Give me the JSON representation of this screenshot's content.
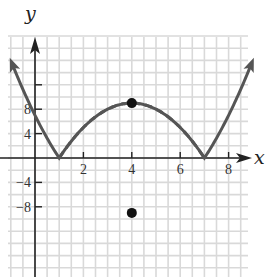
{
  "chart_data": {
    "type": "line",
    "title": "",
    "xlabel": "x",
    "ylabel": "y",
    "xlim": [
      -1.1,
      9.1
    ],
    "ylim": [
      -19.5,
      20
    ],
    "grid": true,
    "grid_step": {
      "x": 0.5,
      "y": 2
    },
    "x_ticks": [
      2,
      4,
      6,
      8
    ],
    "x_tick_labels": [
      "2",
      "4",
      "6",
      "8"
    ],
    "y_ticks": [
      -8,
      -4,
      4,
      8,
      12
    ],
    "y_tick_labels": [
      "-8",
      "-4",
      "4",
      "8",
      ""
    ],
    "series": [
      {
        "name": "y = |-x^2 + 8x - 7|",
        "style": "solid",
        "color": "#555555",
        "description": "Absolute value of parabola, zeros at x=1 and x=7, local max at (4, 9), arrows at both ends",
        "points": [
          [
            -0.9,
            15.0
          ],
          [
            0,
            7
          ],
          [
            1,
            0
          ],
          [
            2,
            5
          ],
          [
            3,
            8
          ],
          [
            4,
            9
          ],
          [
            5,
            8
          ],
          [
            6,
            5
          ],
          [
            7,
            0
          ],
          [
            8,
            7
          ],
          [
            8.9,
            15.0
          ]
        ]
      },
      {
        "name": "y = -x^2 + 8x - 7 (reflected portion)",
        "style": "dashed",
        "color": "#555555",
        "description": "Portion of original parabola below x-axis between zeros, shown dashed",
        "points": [
          [
            1,
            0
          ],
          [
            2,
            -5
          ],
          [
            3,
            -8
          ],
          [
            4,
            -9
          ],
          [
            5,
            -8
          ],
          [
            6,
            -5
          ],
          [
            7,
            0
          ]
        ]
      }
    ],
    "marked_points": [
      {
        "x": 4,
        "y": 9,
        "label": ""
      },
      {
        "x": 4,
        "y": -9,
        "label": ""
      }
    ],
    "colors": {
      "curve": "#555555",
      "axis": "#222222",
      "grid": "#d9d9d9",
      "point": "#111111"
    }
  }
}
